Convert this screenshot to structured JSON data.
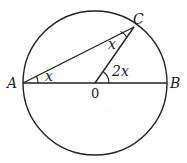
{
  "diagram": {
    "type": "circle-geometry",
    "circle": {
      "cx": 95,
      "cy": 83,
      "r": 72
    },
    "points": {
      "A": {
        "label": "A",
        "x": 23,
        "y": 83
      },
      "B": {
        "label": "B",
        "x": 167,
        "y": 83
      },
      "C": {
        "label": "C",
        "x": 134,
        "y": 27
      },
      "O": {
        "label": "0",
        "x": 95,
        "y": 83
      }
    },
    "segments": [
      "AB",
      "AC",
      "OC"
    ],
    "angles": [
      {
        "vertex": "A",
        "label": "x"
      },
      {
        "vertex": "C",
        "label": "x"
      },
      {
        "vertex": "O",
        "label": "2x"
      }
    ],
    "stroke_color": "#222222"
  }
}
